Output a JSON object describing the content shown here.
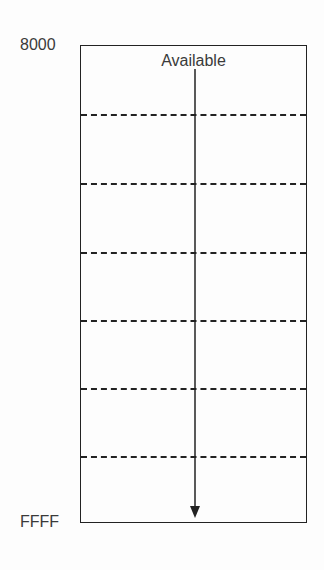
{
  "diagram": {
    "type": "memory-map",
    "addresses": {
      "top": "8000",
      "bottom": "FFFF"
    },
    "region_label": "Available",
    "dividers": 6,
    "arrow_direction": "down",
    "colors": {
      "line": "#222222",
      "text": "#3a3a3a",
      "background": "#fdfdfd"
    }
  }
}
